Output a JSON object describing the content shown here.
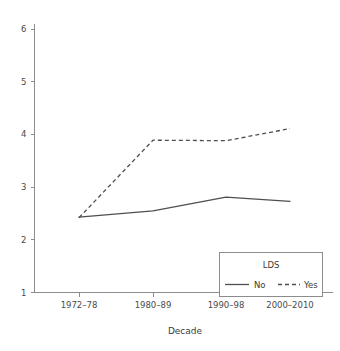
{
  "chart_data": {
    "type": "line",
    "title": "",
    "xlabel": "Decade",
    "ylabel": "",
    "categories": [
      "1972–78",
      "1980–89",
      "1990–98",
      "2000–2010"
    ],
    "series": [
      {
        "name": "No",
        "style": "solid",
        "values": [
          2.43,
          2.55,
          2.81,
          2.73
        ]
      },
      {
        "name": "Yes",
        "style": "dashed",
        "values": [
          2.42,
          3.89,
          3.88,
          4.11
        ]
      }
    ],
    "ylim": [
      1,
      6
    ],
    "yticks": [
      1,
      2,
      3,
      4,
      5,
      6
    ],
    "ytick_labels": [
      "1",
      "2",
      "3",
      "4",
      "5",
      "6"
    ],
    "grid": false,
    "legend": {
      "title": "LDS",
      "position": "bottom-right",
      "entries": [
        {
          "label": "No",
          "style": "solid"
        },
        {
          "label": "Yes",
          "style": "dashed"
        }
      ]
    },
    "colors": {
      "line": "#4f4f4f",
      "axis": "#8c8c8c",
      "text": "#3a3a3a",
      "background": "#ffffff"
    }
  }
}
